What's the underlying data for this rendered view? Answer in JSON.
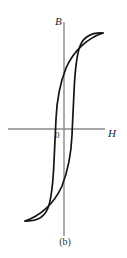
{
  "figure": {
    "caption": "(b)",
    "kind": "hysteresis-loop-diagram"
  },
  "axes": {
    "vertical_label": "B",
    "horizontal_label": "H",
    "origin_label": "0",
    "axis_color": "#8a8a8a",
    "curve_color": "#141414",
    "background_color": "#ffffff"
  },
  "chart_data": {
    "type": "line",
    "title": "",
    "subtitle": "",
    "xlabel": "H",
    "ylabel": "B",
    "grid": false,
    "legend": null,
    "annotations": [
      "0",
      "(b)"
    ],
    "axis_origin_px": {
      "x": 64,
      "y": 129
    },
    "xlim": [
      -64,
      63
    ],
    "ylim": [
      -107,
      107
    ],
    "series": [
      {
        "name": "upper-branch-decreasing-H",
        "points_px": [
          [
            103,
            33
          ],
          [
            95,
            33
          ],
          [
            87,
            36
          ],
          [
            81,
            43
          ],
          [
            77,
            55
          ],
          [
            75,
            72
          ],
          [
            74,
            92
          ],
          [
            73,
            112
          ],
          [
            72,
            129
          ],
          [
            71,
            145
          ],
          [
            69,
            163
          ],
          [
            64,
            182
          ],
          [
            55,
            199
          ],
          [
            42,
            213
          ],
          [
            25,
            221
          ]
        ]
      },
      {
        "name": "lower-branch-increasing-H",
        "points_px": [
          [
            25,
            221
          ],
          [
            33,
            221
          ],
          [
            41,
            218
          ],
          [
            47,
            211
          ],
          [
            51,
            199
          ],
          [
            53,
            182
          ],
          [
            54,
            162
          ],
          [
            55,
            142
          ],
          [
            56,
            125
          ],
          [
            57,
            109
          ],
          [
            59,
            91
          ],
          [
            64,
            72
          ],
          [
            73,
            55
          ],
          [
            86,
            41
          ],
          [
            103,
            33
          ]
        ]
      }
    ],
    "key_points_px": {
      "positive_saturation_tip": [
        103,
        33
      ],
      "negative_saturation_tip": [
        25,
        221
      ],
      "positive_remanence_on_B_axis": [
        64,
        72
      ],
      "negative_remanence_on_B_axis": [
        64,
        182
      ],
      "positive_coercivity_on_H_axis": [
        77,
        129
      ],
      "negative_coercivity_on_H_axis": [
        49,
        129
      ]
    },
    "axis_extent_px": {
      "vertical_top": 22,
      "vertical_bottom": 236,
      "horizontal_left": 8,
      "horizontal_right": 105,
      "vertical_x": 64,
      "horizontal_y": 129
    }
  }
}
